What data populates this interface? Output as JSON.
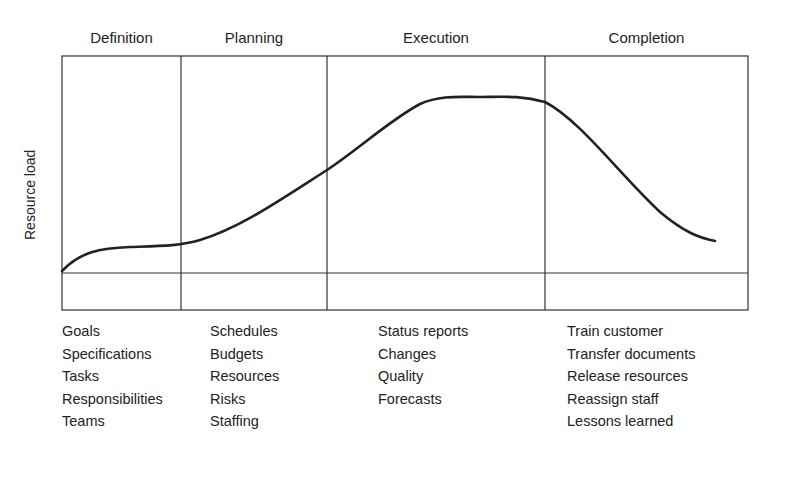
{
  "diagram": {
    "type": "project-life-cycle",
    "y_axis_label": "Resource load",
    "phases": [
      {
        "name": "Definition",
        "activities": [
          "Goals",
          "Specifications",
          "Tasks",
          "Responsibilities",
          "Teams"
        ]
      },
      {
        "name": "Planning",
        "activities": [
          "Schedules",
          "Budgets",
          "Resources",
          "Risks",
          "Staffing"
        ]
      },
      {
        "name": "Execution",
        "activities": [
          "Status reports",
          "Changes",
          "Quality",
          "Forecasts"
        ]
      },
      {
        "name": "Completion",
        "activities": [
          "Train customer",
          "Transfer documents",
          "Release resources",
          "Reassign staff",
          "Lessons learned"
        ]
      }
    ],
    "curve_description": "Resource load rises slowly in Definition, increases through Planning, peaks in Execution, then declines sharply in Completion",
    "line_color": "#222222"
  }
}
